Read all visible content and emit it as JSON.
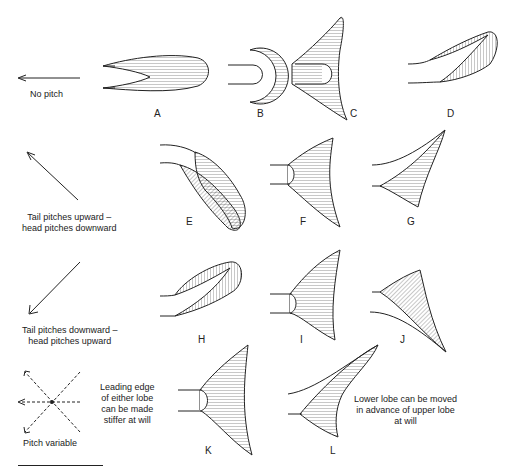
{
  "diagram": {
    "type": "fish caudal fin pitch control illustration",
    "rows": [
      {
        "direction": "no-pitch",
        "caption": "No pitch",
        "panels": [
          "A",
          "B",
          "C",
          "D"
        ]
      },
      {
        "direction": "tail-up",
        "caption_line1": "Tail pitches upward –",
        "caption_line2": "head pitches downward",
        "panels": [
          "E",
          "F",
          "G"
        ]
      },
      {
        "direction": "tail-down",
        "caption_line1": "Tail pitches downward –",
        "caption_line2": "head pitches upward",
        "panels": [
          "H",
          "I",
          "J"
        ]
      },
      {
        "direction": "variable",
        "caption": "Pitch variable",
        "note_left": [
          "Leading edge",
          "of either lobe",
          "can be made",
          "stiffer at will"
        ],
        "note_right": [
          "Lower lobe can be moved",
          "in advance of upper lobe",
          "at will"
        ],
        "panels": [
          "K",
          "L"
        ]
      }
    ],
    "letters": {
      "A": "A",
      "B": "B",
      "C": "C",
      "D": "D",
      "E": "E",
      "F": "F",
      "G": "G",
      "H": "H",
      "I": "I",
      "J": "J",
      "K": "K",
      "L": "L"
    },
    "colors": {
      "line": "#222222",
      "background": "#ffffff"
    }
  }
}
